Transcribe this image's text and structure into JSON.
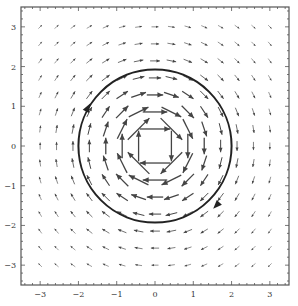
{
  "chart_data": {
    "type": "quiver",
    "title": "",
    "xlabel": "",
    "ylabel": "",
    "xlim": [
      -3.5,
      3.5
    ],
    "ylim": [
      -3.5,
      3.5
    ],
    "x_ticks": [
      -3,
      -2,
      -1,
      0,
      1,
      2,
      3
    ],
    "y_ticks": [
      -3,
      -2,
      -1,
      0,
      1,
      2,
      3
    ],
    "x_tick_labels": [
      "-3",
      "-2",
      "-1",
      "0",
      "1",
      "2",
      "3"
    ],
    "y_tick_labels": [
      "-3",
      "-2",
      "-1",
      "0",
      "1",
      "2",
      "3"
    ],
    "minor_ticks_per_unit": 5,
    "grid": false,
    "legend": null,
    "vector_field": {
      "description": "Clockwise rotational field F(x,y) = (y, -x)/(x^2+y^2)",
      "formula_x": "y/(x^2+y^2)",
      "formula_y": "-x/(x^2+y^2)",
      "grid_range": [
        -3,
        3
      ],
      "grid_count": 15,
      "circulation": "clockwise"
    },
    "curves": [
      {
        "type": "circle",
        "center": [
          0,
          0
        ],
        "radius": 2,
        "orientation": "clockwise",
        "direction_arrows": [
          {
            "at": [
              -1.75,
              0.97
            ],
            "direction": "up-right"
          },
          {
            "at": [
              1.6,
              -1.5
            ],
            "direction": "down-left"
          }
        ]
      }
    ]
  },
  "colors": {
    "frame": "#555555",
    "arrow": "#444444",
    "curve": "#222222",
    "background": "#ffffff"
  }
}
